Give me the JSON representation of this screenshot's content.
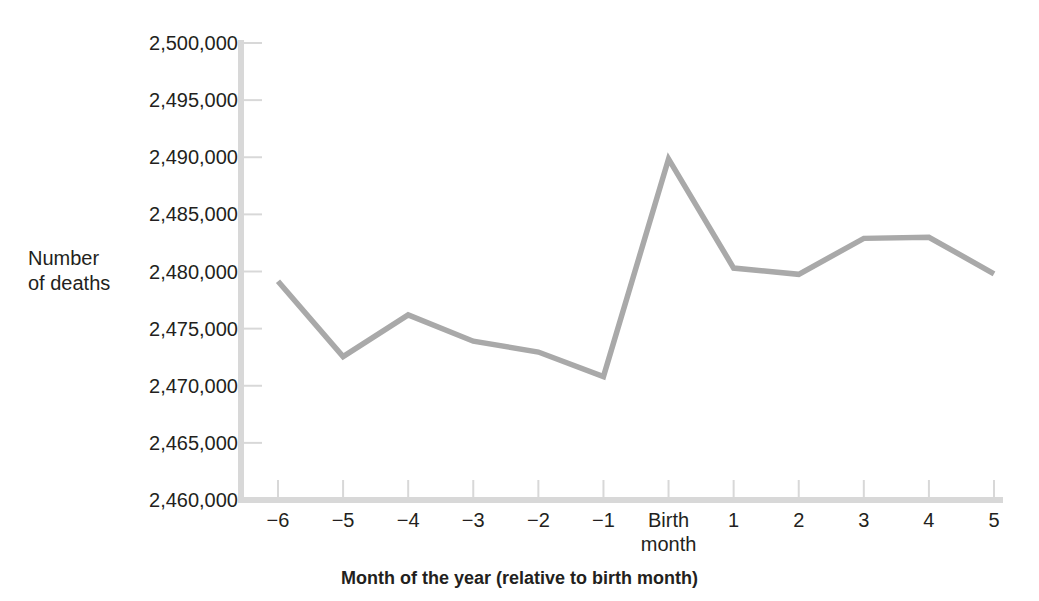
{
  "chart_data": {
    "type": "line",
    "title": "",
    "xlabel": "Month of the year (relative to birth month)",
    "ylabel": "Number\nof deaths",
    "ylabel_line1": "Number",
    "ylabel_line2": "of deaths",
    "categories": [
      "−6",
      "−5",
      "−4",
      "−3",
      "−2",
      "−1",
      "Birth\nmonth",
      "1",
      "2",
      "3",
      "4",
      "5"
    ],
    "x_tick_labels": [
      "−6",
      "−5",
      "−4",
      "−3",
      "−2",
      "−1",
      "Birth\nmonth",
      "1",
      "2",
      "3",
      "4",
      "5"
    ],
    "values": [
      2479150,
      2472550,
      2476200,
      2473900,
      2472950,
      2470800,
      2489850,
      2480300,
      2479750,
      2482900,
      2483000,
      2479800
    ],
    "y_tick_labels": [
      "2,500,000",
      "2,495,000",
      "2,490,000",
      "2,485,000",
      "2,480,000",
      "2,475,000",
      "2,470,000",
      "2,465,000",
      "2,460,000"
    ],
    "y_tick_values": [
      2500000,
      2495000,
      2490000,
      2485000,
      2480000,
      2475000,
      2470000,
      2465000,
      2460000
    ],
    "ylim": [
      2460000,
      2500000
    ],
    "y_tick_step": 5000,
    "grid": false,
    "legend": "none",
    "series_color": "#a9a9a9",
    "axis_color": "#d8d8d8",
    "text_color": "#231f20"
  },
  "layout": {
    "plot_left": 278,
    "plot_right": 994,
    "plot_top": 43,
    "plot_bottom": 500,
    "axis_x": 241,
    "x_step": 65.09,
    "y_per_unit": 0.011428
  }
}
